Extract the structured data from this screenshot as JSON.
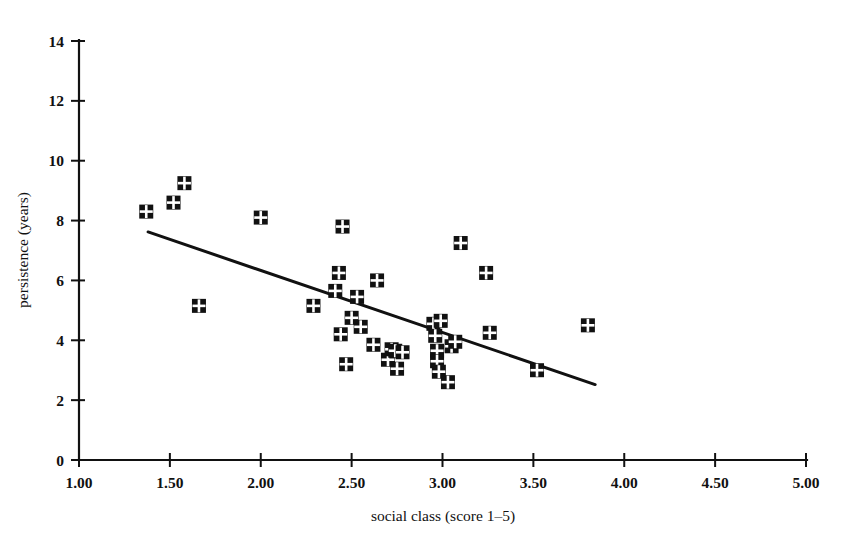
{
  "chart_data": {
    "type": "scatter",
    "title": "",
    "xlabel": "social class (score 1–5)",
    "ylabel": "persistence (years)",
    "xlim": [
      1.0,
      5.0
    ],
    "ylim": [
      0,
      14
    ],
    "xticks": [
      1.0,
      1.5,
      2.0,
      2.5,
      3.0,
      3.5,
      4.0,
      4.5,
      5.0
    ],
    "xtick_labels": [
      "1.00",
      "1.50",
      "2.00",
      "2.50",
      "3.00",
      "3.50",
      "4.00",
      "4.50",
      "5.00"
    ],
    "yticks": [
      0,
      2,
      4,
      6,
      8,
      10,
      12,
      14
    ],
    "ytick_labels": [
      "0",
      "2",
      "4",
      "6",
      "8",
      "10",
      "12",
      "14"
    ],
    "grid": false,
    "legend": null,
    "marker_style": "filled-square-with-white-cross",
    "marker_color": "#111111",
    "points": [
      {
        "x": 1.37,
        "y": 8.3
      },
      {
        "x": 1.52,
        "y": 8.6
      },
      {
        "x": 1.58,
        "y": 9.25
      },
      {
        "x": 1.66,
        "y": 5.15
      },
      {
        "x": 2.0,
        "y": 8.1
      },
      {
        "x": 2.29,
        "y": 5.15
      },
      {
        "x": 2.41,
        "y": 5.65
      },
      {
        "x": 2.43,
        "y": 6.25
      },
      {
        "x": 2.44,
        "y": 4.2
      },
      {
        "x": 2.45,
        "y": 7.8
      },
      {
        "x": 2.47,
        "y": 3.2
      },
      {
        "x": 2.5,
        "y": 4.75
      },
      {
        "x": 2.53,
        "y": 5.45
      },
      {
        "x": 2.55,
        "y": 4.45
      },
      {
        "x": 2.62,
        "y": 3.85
      },
      {
        "x": 2.64,
        "y": 6.0
      },
      {
        "x": 2.7,
        "y": 3.35
      },
      {
        "x": 2.72,
        "y": 3.7
      },
      {
        "x": 2.74,
        "y": 3.65
      },
      {
        "x": 2.75,
        "y": 3.05
      },
      {
        "x": 2.78,
        "y": 3.6
      },
      {
        "x": 2.95,
        "y": 4.55
      },
      {
        "x": 2.96,
        "y": 4.15
      },
      {
        "x": 2.97,
        "y": 3.65
      },
      {
        "x": 2.97,
        "y": 3.3
      },
      {
        "x": 2.98,
        "y": 2.95
      },
      {
        "x": 2.99,
        "y": 4.65
      },
      {
        "x": 3.03,
        "y": 2.6
      },
      {
        "x": 3.05,
        "y": 3.8
      },
      {
        "x": 3.07,
        "y": 3.95
      },
      {
        "x": 3.1,
        "y": 7.25
      },
      {
        "x": 3.24,
        "y": 6.25
      },
      {
        "x": 3.26,
        "y": 4.25
      },
      {
        "x": 3.52,
        "y": 3.0
      },
      {
        "x": 3.8,
        "y": 4.5
      }
    ],
    "fit_line": {
      "type": "linear-regression",
      "x_start": 1.38,
      "y_start": 7.62,
      "x_end": 3.84,
      "y_end": 2.52
    },
    "bleed_top": "",
    "bleed_bottom": ""
  },
  "figure": {
    "background": "#ffffff",
    "ink": "#111111"
  }
}
